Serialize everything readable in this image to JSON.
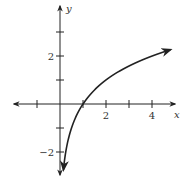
{
  "chart_data": {
    "type": "line",
    "title": "",
    "xlabel": "x",
    "ylabel": "y",
    "function": "y = log2(x)",
    "xlim": [
      -2,
      5
    ],
    "ylim": [
      -3,
      3
    ],
    "x_ticks": [
      -1,
      1,
      2,
      3,
      4
    ],
    "x_tick_labels": [
      {
        "value": 2,
        "label": "2"
      },
      {
        "value": 4,
        "label": "4"
      }
    ],
    "y_ticks": [
      -2,
      -1,
      1,
      2,
      3
    ],
    "y_tick_labels": [
      {
        "value": 2,
        "label": "2"
      },
      {
        "value": -2,
        "label": "−2"
      }
    ],
    "grid": false,
    "series": [
      {
        "name": "curve",
        "x": [
          0.15,
          0.25,
          0.5,
          1,
          1.5,
          2,
          2.5,
          3,
          3.5,
          4,
          4.5,
          4.8
        ],
        "y": [
          -2.74,
          -2,
          -1,
          0,
          0.58,
          1,
          1.32,
          1.58,
          1.81,
          2,
          2.17,
          2.26
        ]
      }
    ],
    "annotations": [
      "arrowheads on both ends of curve",
      "arrowheads on both ends of axes"
    ]
  },
  "axes": {
    "x_label": "x",
    "y_label": "y"
  }
}
